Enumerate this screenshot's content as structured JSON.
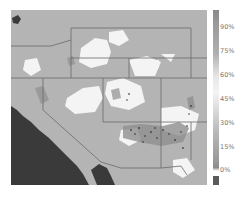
{
  "map": {
    "region": "Southwestern United States",
    "colors": {
      "background_land": "#b4b4b4",
      "ocean": "#3a3a3a",
      "high_value": "#ffffff",
      "mid_value": "#8e8e8e",
      "borders": "#6a6a6a"
    }
  },
  "colorbar": {
    "ticks": [
      {
        "label": "90%",
        "top": 24
      },
      {
        "label": "75%",
        "top": 48
      },
      {
        "label": "60%",
        "top": 72
      },
      {
        "label": "45%",
        "top": 96
      },
      {
        "label": "30%",
        "top": 120
      },
      {
        "label": "15%",
        "top": 144
      },
      {
        "label": "0%",
        "top": 167
      }
    ]
  }
}
